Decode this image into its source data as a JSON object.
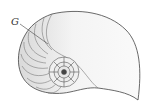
{
  "figure": {
    "label": "G",
    "colors": {
      "outline": "#444444",
      "shell_fill": "#f3f3f3",
      "shade": "#d6d6d6",
      "septa": "#666666"
    }
  }
}
